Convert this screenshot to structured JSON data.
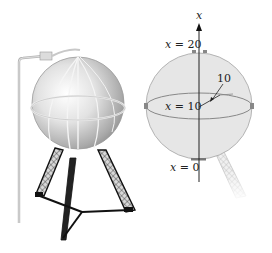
{
  "figure": {
    "left_panel": {
      "subject": "spherical water tank on lattice tower legs",
      "icon": "water-tank-illustration"
    },
    "right_panel": {
      "axis_label": "x",
      "labels": {
        "top": "x = 20",
        "middle": "x = 10",
        "bottom": "x = 0",
        "radius": "10"
      },
      "colors": {
        "sphere_fill": "#e6e6e6",
        "sphere_stroke": "#999999",
        "axis": "#222222",
        "markers": "#888888"
      }
    }
  }
}
